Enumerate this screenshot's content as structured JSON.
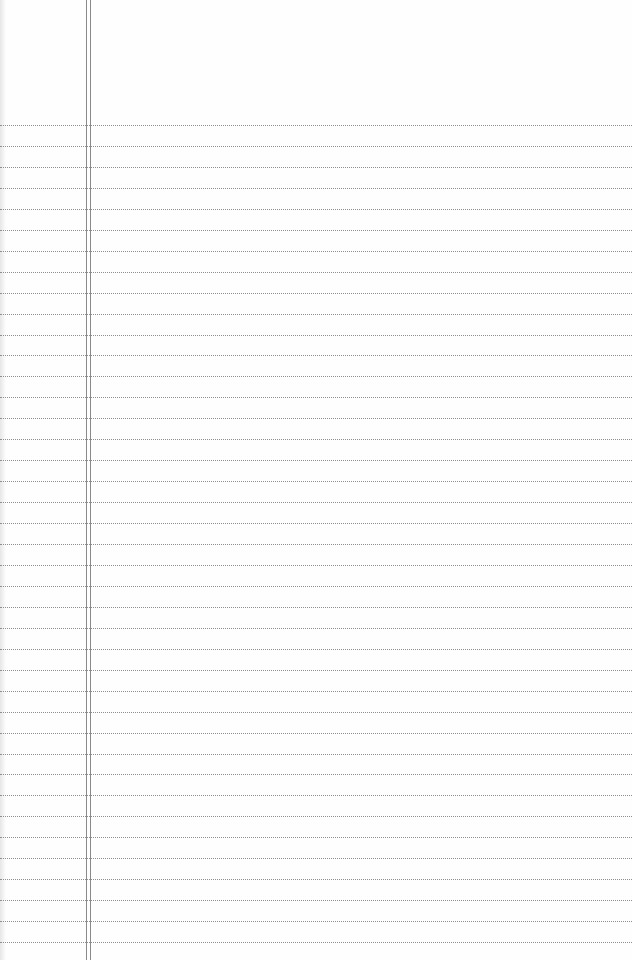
{
  "page": {
    "type": "lined-notepad-paper",
    "background_color": "#fefefe",
    "rule_color": "#8f8f8f",
    "margin_line_color": "#8a8a8a",
    "rules": {
      "count": 40,
      "first_y": 125,
      "spacing": 20.95
    },
    "margin_lines_x": [
      86,
      90
    ]
  }
}
